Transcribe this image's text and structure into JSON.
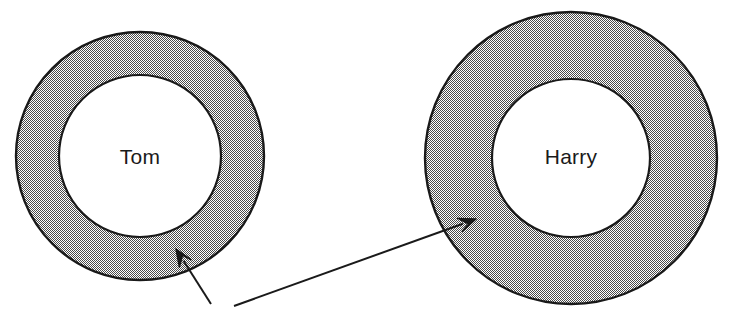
{
  "diagram": {
    "type": "annulus-callout-diagram",
    "background_color": "#ffffff",
    "stroke_color": "#1a1a1a",
    "fill_color": "#8c8c8c",
    "fill_pattern": "dithered-halftone-gray",
    "rings": [
      {
        "id": "tom",
        "label": "Tom",
        "center_x": 140,
        "center_y": 156,
        "outer_radius": 124,
        "inner_radius": 81,
        "ring_thickness": 43,
        "label_x": 140,
        "label_y": 158
      },
      {
        "id": "harry",
        "label": "Harry",
        "center_x": 571,
        "center_y": 158,
        "outer_radius": 146,
        "inner_radius": 79,
        "ring_thickness": 67,
        "label_x": 571,
        "label_y": 158
      }
    ],
    "arrows": [
      {
        "id": "arrow-to-tom",
        "target": "tom",
        "tail_x": 211,
        "tail_y": 304,
        "tip_x": 176,
        "tip_y": 249,
        "head_size": 17
      },
      {
        "id": "arrow-to-harry",
        "target": "harry",
        "tail_x": 234,
        "tail_y": 306,
        "tip_x": 476,
        "tip_y": 219,
        "head_size": 17
      }
    ]
  }
}
